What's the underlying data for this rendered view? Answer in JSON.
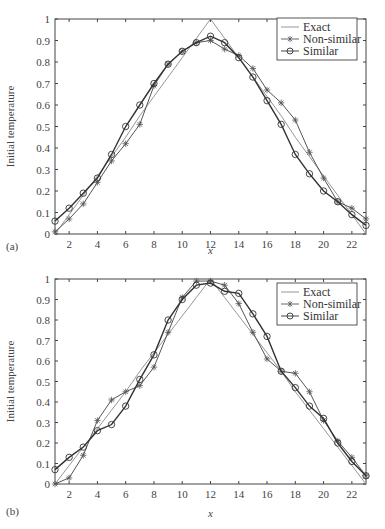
{
  "chart_data": [
    {
      "panel": "(a)",
      "type": "line",
      "title": "",
      "xlabel": "x",
      "ylabel": "Initial temperature",
      "xlim": [
        1,
        23
      ],
      "ylim": [
        0,
        1
      ],
      "xticks": [
        2,
        4,
        6,
        8,
        10,
        12,
        14,
        16,
        18,
        20,
        22
      ],
      "yticks": [
        0,
        0.1,
        0.2,
        0.3,
        0.4,
        0.5,
        0.6,
        0.7,
        0.8,
        0.9,
        1
      ],
      "grid": false,
      "legend_position": "upper right",
      "x": [
        1,
        2,
        3,
        4,
        5,
        6,
        7,
        8,
        9,
        10,
        11,
        12,
        13,
        14,
        15,
        16,
        17,
        18,
        19,
        20,
        21,
        22,
        23
      ],
      "series": [
        {
          "name": "Exact",
          "marker": "none",
          "values": [
            0,
            0.09,
            0.18,
            0.27,
            0.36,
            0.45,
            0.55,
            0.64,
            0.73,
            0.82,
            0.91,
            1.0,
            0.91,
            0.82,
            0.73,
            0.64,
            0.55,
            0.45,
            0.36,
            0.27,
            0.18,
            0.09,
            0
          ]
        },
        {
          "name": "Non-similar",
          "marker": "asterisk",
          "values": [
            0.01,
            0.07,
            0.14,
            0.24,
            0.34,
            0.42,
            0.51,
            0.69,
            0.79,
            0.85,
            0.89,
            0.9,
            0.86,
            0.83,
            0.77,
            0.67,
            0.61,
            0.53,
            0.38,
            0.26,
            0.15,
            0.12,
            0.07
          ]
        },
        {
          "name": "Similar",
          "marker": "circle",
          "values": [
            0.06,
            0.12,
            0.19,
            0.26,
            0.37,
            0.5,
            0.6,
            0.7,
            0.79,
            0.85,
            0.89,
            0.92,
            0.89,
            0.82,
            0.73,
            0.62,
            0.51,
            0.37,
            0.28,
            0.2,
            0.15,
            0.09,
            0.04
          ]
        }
      ]
    },
    {
      "panel": "(b)",
      "type": "line",
      "title": "",
      "xlabel": "x",
      "ylabel": "Initial temperature",
      "xlim": [
        1,
        23
      ],
      "ylim": [
        0,
        1
      ],
      "xticks": [
        2,
        4,
        6,
        8,
        10,
        12,
        14,
        16,
        18,
        20,
        22
      ],
      "yticks": [
        0,
        0.1,
        0.2,
        0.3,
        0.4,
        0.5,
        0.6,
        0.7,
        0.8,
        0.9,
        1
      ],
      "grid": false,
      "legend_position": "upper right",
      "x": [
        1,
        2,
        3,
        4,
        5,
        6,
        7,
        8,
        9,
        10,
        11,
        12,
        13,
        14,
        15,
        16,
        17,
        18,
        19,
        20,
        21,
        22,
        23
      ],
      "series": [
        {
          "name": "Exact",
          "marker": "none",
          "values": [
            0,
            0.09,
            0.18,
            0.27,
            0.36,
            0.45,
            0.55,
            0.64,
            0.73,
            0.82,
            0.91,
            1.0,
            0.91,
            0.82,
            0.73,
            0.64,
            0.55,
            0.45,
            0.36,
            0.27,
            0.18,
            0.09,
            0
          ]
        },
        {
          "name": "Non-similar",
          "marker": "asterisk",
          "values": [
            0,
            0.03,
            0.14,
            0.31,
            0.41,
            0.45,
            0.48,
            0.57,
            0.74,
            0.91,
            0.99,
            0.99,
            0.97,
            0.88,
            0.74,
            0.61,
            0.55,
            0.54,
            0.45,
            0.31,
            0.21,
            0.13,
            0.04
          ]
        },
        {
          "name": "Similar",
          "marker": "circle",
          "values": [
            0.07,
            0.13,
            0.18,
            0.26,
            0.29,
            0.38,
            0.51,
            0.63,
            0.8,
            0.9,
            0.97,
            0.98,
            0.94,
            0.93,
            0.83,
            0.72,
            0.55,
            0.47,
            0.38,
            0.32,
            0.2,
            0.11,
            0.04
          ]
        }
      ]
    }
  ]
}
